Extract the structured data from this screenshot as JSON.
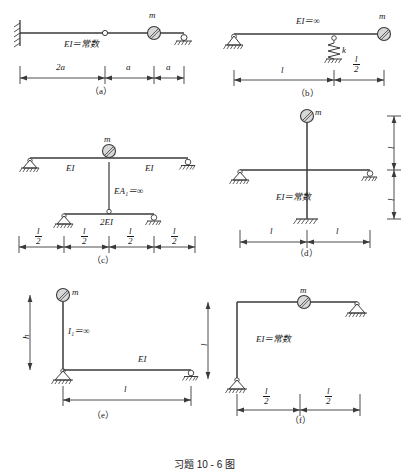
{
  "page": {
    "caption": "习题 10 - 6 图",
    "constant_text": "常数"
  },
  "figures": [
    {
      "id": "a",
      "label": "（a）",
      "mass_label": "m",
      "stiffness_label": "EI＝常数",
      "dimensions": [
        "2a",
        "a",
        "a"
      ],
      "supports": [
        "fixed-wall-left",
        "internal-hinge",
        "roller-right"
      ]
    },
    {
      "id": "b",
      "label": "（b）",
      "mass_label": "m",
      "stiffness_label": "EI＝∞",
      "spring_label": "k",
      "dimensions": [
        "l",
        "l/2"
      ],
      "supports": [
        "pin-left",
        "spring-ground-middle"
      ]
    },
    {
      "id": "c",
      "label": "（c）",
      "mass_label": "m",
      "upper_left_label": "EI",
      "upper_right_label": "EI",
      "link_label": "EA₁＝∞",
      "lower_label": "2EI",
      "dimensions": [
        "l/2",
        "l/2",
        "l/2",
        "l/2"
      ],
      "supports": [
        "pin-upper-left",
        "roller-upper-right",
        "pin-lower-left",
        "roller-lower-right"
      ]
    },
    {
      "id": "d",
      "label": "（d）",
      "mass_label": "m",
      "stiffness_label": "EI＝常数",
      "dimensions_h": [
        "l",
        "l"
      ],
      "dimensions_v": [
        "l",
        "l"
      ],
      "supports": [
        "pin-beam-left",
        "roller-beam-right",
        "fixed-column-base"
      ]
    },
    {
      "id": "e",
      "label": "（e）",
      "mass_label": "m",
      "column_label": "I₁＝∞",
      "beam_label": "EI",
      "height_label": "h",
      "span_label": "l",
      "supports": [
        "pin-base-left",
        "roller-right"
      ]
    },
    {
      "id": "f",
      "label": "（f）",
      "mass_label": "m",
      "stiffness_label": "EI＝常数",
      "height_label": "l",
      "dimensions": [
        "l/2",
        "l/2"
      ],
      "supports": [
        "pin-base",
        "pin-right"
      ]
    }
  ],
  "colors": {
    "line": "#3a3a3a",
    "text": "#1a1a1a",
    "mass_fill": "#d8d8d8",
    "background": "#ffffff"
  }
}
